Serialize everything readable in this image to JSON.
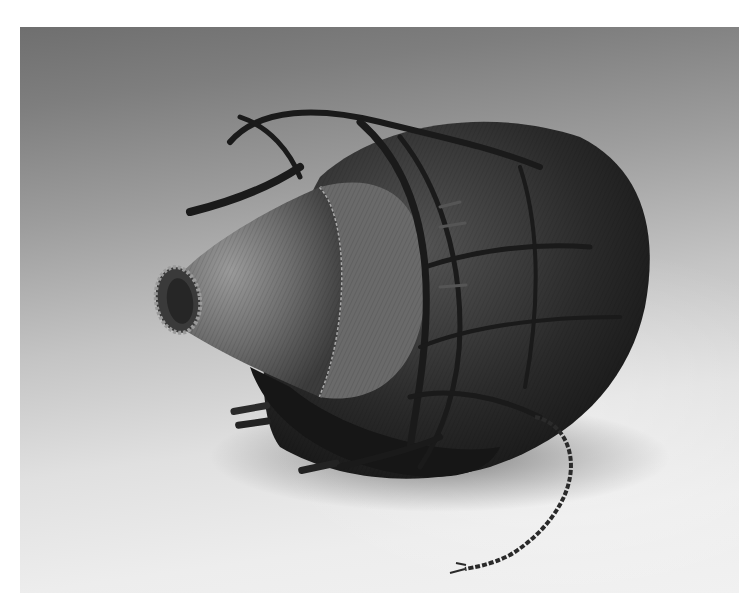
{
  "image": {
    "subject": "Woven basket with conical lid and rope netting",
    "alt": "Black-and-white photograph of a woven fiber basket with a conical spouted lid, wrapped in knotted rope netting, on a gradient gray backdrop"
  },
  "colors": {
    "backdrop_top": "#6f6f6f",
    "backdrop_bottom": "#f1f1f1",
    "basket_dark": "#1e1e1e",
    "basket_mid": "#4a4a4a",
    "lid_light": "#8a8a8a"
  }
}
